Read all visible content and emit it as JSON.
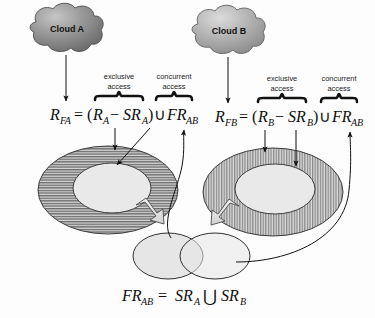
{
  "figure": {
    "background_color": "#fdfdfd",
    "stroke_color": "#111111"
  },
  "clouds": [
    {
      "id": "cloud-a",
      "label": "Cloud A",
      "fill_light": "#b9b9b9",
      "fill_dark": "#6f6f6f"
    },
    {
      "id": "cloud-b",
      "label": "Cloud B",
      "fill_light": "#cfcfcf",
      "fill_dark": "#8d8d8d"
    }
  ],
  "annotations": {
    "exclusive_line1": "exclusive",
    "exclusive_line2": "access",
    "concurrent_line1": "concurrent",
    "concurrent_line2": "access"
  },
  "formulas": {
    "left": {
      "lhs_base": "R",
      "lhs_sub": "FA",
      "equals": "=",
      "open_paren": "(",
      "term1_base": "R",
      "term1_sub": "A",
      "minus": "−",
      "term2_base": "SR",
      "term2_sub": "A",
      "close_paren": ")",
      "union": "∪",
      "term3_base": "FR",
      "term3_sub": "AB"
    },
    "right": {
      "lhs_base": "R",
      "lhs_sub": "FB",
      "equals": "=",
      "open_paren": "(",
      "term1_base": "R",
      "term1_sub": "B",
      "minus": "−",
      "term2_base": "SR",
      "term2_sub": "B",
      "close_paren": ")",
      "union": "∪",
      "term3_base": "FR",
      "term3_sub": "AB"
    },
    "bottom": {
      "lhs_base": "FR",
      "lhs_sub": "AB",
      "equals": "=",
      "term1_base": "SR",
      "term1_sub": "A",
      "union": "⋃",
      "term2_base": "SR",
      "term2_sub": "B"
    }
  },
  "regions": {
    "left_outer": {
      "name": "cloud-a-resource-pool",
      "hatch": "horizontal",
      "fill": "#8f8f8f"
    },
    "left_inner": {
      "name": "cloud-a-shared-core",
      "fill": "#e9e9e9"
    },
    "right_outer": {
      "name": "cloud-b-resource-pool",
      "hatch": "vertical",
      "fill": "#a5a5a5"
    },
    "right_inner": {
      "name": "cloud-b-shared-core",
      "fill": "#e9e9e9"
    },
    "venn_left": {
      "name": "shared-resource-a",
      "fill": "#e4e4e4"
    },
    "venn_right": {
      "name": "shared-resource-b",
      "fill": "#e4e4e4"
    }
  }
}
